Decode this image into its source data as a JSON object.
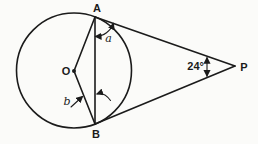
{
  "figure": {
    "background_color": "#fbfbf9",
    "line_color": "#1b1b1b",
    "labels": {
      "point_a": "A",
      "point_b": "B",
      "centre": "O",
      "external_point": "P",
      "angle_at_a": "a",
      "angle_at_b": "b",
      "angle_at_p": "24°"
    },
    "angle_at_p_value_degrees": 24,
    "icons": {
      "centre_dot": "filled-dot",
      "angle_a_marker": "double-headed-arc-arrow",
      "angle_b_markers": "inward-pointing-arrows",
      "angle_p_marker": "vertical-double-headed-arrow"
    }
  }
}
